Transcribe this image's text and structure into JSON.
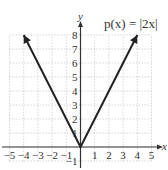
{
  "chart_data": {
    "type": "line",
    "title": "p(x) = |2x|",
    "function_label": "p(x) = |2x|",
    "xlabel": "x",
    "ylabel": "y",
    "xlim": [
      -5,
      5
    ],
    "ylim": [
      -1,
      8
    ],
    "grid": true,
    "x_ticks": [
      "−5",
      "−4",
      "−3",
      "−2",
      "−1",
      "1",
      "2",
      "3",
      "4",
      "5"
    ],
    "y_ticks": [
      "−1",
      "1",
      "2",
      "3",
      "4",
      "5",
      "6",
      "7",
      "8"
    ],
    "series": [
      {
        "name": "p(x) = |2x|",
        "x": [
          -4,
          -3,
          -2,
          -1,
          0,
          1,
          2,
          3,
          4
        ],
        "y": [
          8,
          6,
          4,
          2,
          0,
          2,
          4,
          6,
          8
        ]
      }
    ]
  }
}
